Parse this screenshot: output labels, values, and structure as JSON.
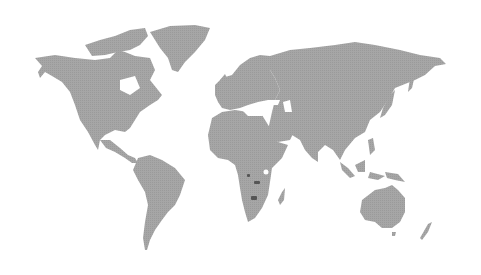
{
  "map": {
    "type": "world-choropleth",
    "background_color": "#ffffff",
    "land_color": "#a3a3a3",
    "highlight_color": "#555555",
    "highlighted_regions": [
      {
        "name": "highlight-central-africa-1",
        "x": 247,
        "y": 174,
        "w": 3,
        "h": 3
      },
      {
        "name": "highlight-central-africa-2",
        "x": 254,
        "y": 181,
        "w": 6,
        "h": 3
      },
      {
        "name": "highlight-southern-africa-3",
        "x": 251,
        "y": 196,
        "w": 6,
        "h": 4
      }
    ]
  }
}
